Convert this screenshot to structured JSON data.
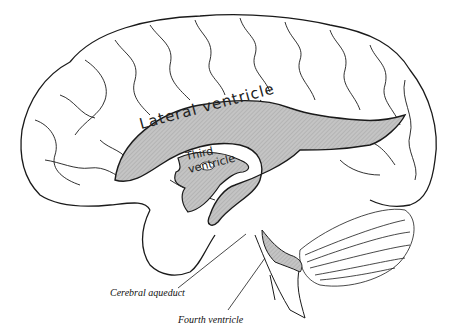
{
  "figure": {
    "structures": {
      "lateral_ventricle": "Lateral ventricle",
      "third_ventricle_line1": "Third",
      "third_ventricle_line2": "ventricle",
      "cerebral_aqueduct": "Cerebral aqueduct",
      "fourth_ventricle": "Fourth ventricle"
    },
    "colors": {
      "outline": "#1a1a1a",
      "ventricle_fill": "#bdbdbd",
      "background": "#ffffff"
    }
  }
}
